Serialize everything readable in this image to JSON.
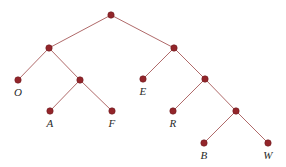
{
  "figure": {
    "name": "binary-tree-diagram",
    "width": 286,
    "height": 167,
    "background": "#ffffff"
  },
  "style": {
    "node_fill": "#93252a",
    "node_stroke": "#6f1b20",
    "edge_color": "#b06a6a",
    "edge_width": 1,
    "node_radius": 3.2,
    "label_color": "#2a2a2a"
  },
  "chart_data": {
    "type": "diagram",
    "title": "",
    "nodes": [
      {
        "id": "root",
        "label": "",
        "x": 111,
        "y": 15
      },
      {
        "id": "n-l",
        "label": "",
        "x": 49,
        "y": 48
      },
      {
        "id": "n-r",
        "label": "",
        "x": 174,
        "y": 48
      },
      {
        "id": "o",
        "label": "O",
        "x": 18,
        "y": 80
      },
      {
        "id": "n-af",
        "label": "",
        "x": 80,
        "y": 80
      },
      {
        "id": "a",
        "label": "A",
        "x": 50,
        "y": 111
      },
      {
        "id": "f",
        "label": "F",
        "x": 112,
        "y": 111
      },
      {
        "id": "e",
        "label": "E",
        "x": 143,
        "y": 79
      },
      {
        "id": "n-rb",
        "label": "",
        "x": 205,
        "y": 79
      },
      {
        "id": "r",
        "label": "R",
        "x": 173,
        "y": 111
      },
      {
        "id": "n-bw",
        "label": "",
        "x": 236,
        "y": 111
      },
      {
        "id": "b",
        "label": "B",
        "x": 204,
        "y": 143
      },
      {
        "id": "w",
        "label": "W",
        "x": 268,
        "y": 143
      }
    ],
    "edges": [
      {
        "from": "root",
        "to": "n-l"
      },
      {
        "from": "root",
        "to": "n-r"
      },
      {
        "from": "n-l",
        "to": "o"
      },
      {
        "from": "n-l",
        "to": "n-af"
      },
      {
        "from": "n-af",
        "to": "a"
      },
      {
        "from": "n-af",
        "to": "f"
      },
      {
        "from": "n-r",
        "to": "e"
      },
      {
        "from": "n-r",
        "to": "n-rb"
      },
      {
        "from": "n-rb",
        "to": "r"
      },
      {
        "from": "n-rb",
        "to": "n-bw"
      },
      {
        "from": "n-bw",
        "to": "b"
      },
      {
        "from": "n-bw",
        "to": "w"
      }
    ],
    "labels": [
      {
        "node": "o",
        "text": "O",
        "x": 18,
        "y": 87
      },
      {
        "node": "a",
        "text": "A",
        "x": 50,
        "y": 118
      },
      {
        "node": "f",
        "text": "F",
        "x": 112,
        "y": 118
      },
      {
        "node": "e",
        "text": "E",
        "x": 143,
        "y": 86
      },
      {
        "node": "r",
        "text": "R",
        "x": 173,
        "y": 118
      },
      {
        "node": "b",
        "text": "B",
        "x": 204,
        "y": 150
      },
      {
        "node": "w",
        "text": "W",
        "x": 268,
        "y": 150
      }
    ]
  }
}
